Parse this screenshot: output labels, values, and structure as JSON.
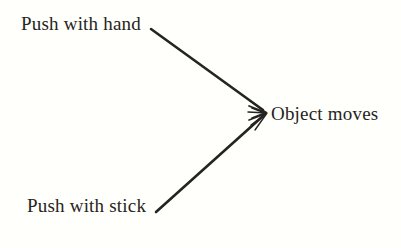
{
  "diagram": {
    "type": "causal-convergence-diagram",
    "background_color": "#fffffc",
    "ink_color": "#262421",
    "nodes": [
      {
        "id": "cause_hand",
        "label": "Push with hand",
        "role": "cause",
        "x": 21,
        "y": 14
      },
      {
        "id": "cause_stick",
        "label": "Push with stick",
        "role": "cause",
        "x": 27,
        "y": 196
      },
      {
        "id": "effect",
        "label": "Object moves",
        "role": "effect",
        "x": 271,
        "y": 104
      }
    ],
    "arrows": [
      {
        "id": "arrow-hand-to-object",
        "from": "cause_hand",
        "to": "effect",
        "start_x": 151,
        "start_y": 29,
        "end_x": 267,
        "end_y": 113,
        "style": "solid",
        "head": "open-barbed"
      },
      {
        "id": "arrow-stick-to-object",
        "from": "cause_stick",
        "to": "effect",
        "start_x": 156,
        "start_y": 212,
        "end_x": 267,
        "end_y": 113,
        "style": "solid",
        "head": "open-barbed"
      }
    ]
  }
}
